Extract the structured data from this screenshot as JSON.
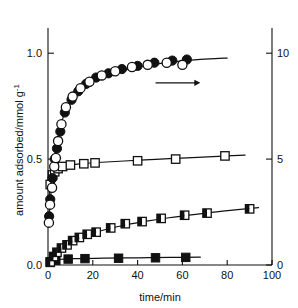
{
  "figure": {
    "background_color": "#ffffff",
    "ink_color": "#111111"
  },
  "axes": {
    "x": {
      "label": "time/min",
      "ticks": [
        0,
        20,
        40,
        60,
        80,
        100
      ],
      "tick_labels": [
        "0",
        "20",
        "40",
        "60",
        "80",
        "100"
      ],
      "range": [
        0,
        100
      ]
    },
    "y_left": {
      "label_main": "amount adsorbed/mmol g",
      "label_exponent": "-1",
      "ticks": [
        0.0,
        0.5,
        1.0
      ],
      "tick_labels": [
        "0.0",
        "0.5",
        "1.0"
      ],
      "range": [
        0,
        1.1
      ]
    },
    "y_right": {
      "label": "",
      "ticks": [
        0,
        5,
        10
      ],
      "tick_labels": [
        "0",
        "5",
        "10"
      ],
      "range": [
        0,
        11
      ]
    }
  },
  "annotations": [
    {
      "name": "right-axis-arrow",
      "type": "arrow",
      "direction": "right",
      "x_start": 48,
      "x_end": 68,
      "y": 0.86,
      "text": ""
    }
  ],
  "chart_data": {
    "type": "scatter",
    "title": "",
    "xlabel": "time/min",
    "ylabel": "amount adsorbed/mmol g-1",
    "xlim": [
      0,
      100
    ],
    "ylim": [
      0,
      1.1
    ],
    "ylim_right": [
      0,
      11
    ],
    "grid": false,
    "legend_position": "none",
    "series": [
      {
        "name": "filled-circles",
        "marker": "circle-filled",
        "axis": "left",
        "points": [
          [
            0.5,
            0.23
          ],
          [
            1.0,
            0.31
          ],
          [
            2.0,
            0.41
          ],
          [
            3.0,
            0.5
          ],
          [
            4.0,
            0.55
          ],
          [
            5.5,
            0.63
          ],
          [
            7.5,
            0.72
          ],
          [
            10.5,
            0.78
          ],
          [
            13.5,
            0.82
          ],
          [
            17.0,
            0.855
          ],
          [
            21.5,
            0.885
          ],
          [
            27.0,
            0.905
          ],
          [
            33.0,
            0.925
          ],
          [
            40.0,
            0.94
          ],
          [
            47.5,
            0.955
          ],
          [
            55.5,
            0.965
          ],
          [
            62.0,
            0.97
          ]
        ]
      },
      {
        "name": "open-circles",
        "marker": "circle-open",
        "axis": "left",
        "points": [
          [
            0.4,
            0.2
          ],
          [
            0.9,
            0.285
          ],
          [
            1.8,
            0.365
          ],
          [
            2.8,
            0.465
          ],
          [
            3.5,
            0.505
          ],
          [
            4.5,
            0.585
          ],
          [
            6.0,
            0.665
          ],
          [
            8.0,
            0.745
          ],
          [
            11.0,
            0.795
          ],
          [
            14.5,
            0.835
          ],
          [
            18.5,
            0.865
          ],
          [
            24.0,
            0.895
          ],
          [
            30.0,
            0.915
          ],
          [
            37.5,
            0.935
          ],
          [
            44.5,
            0.945
          ],
          [
            53.0,
            0.955
          ],
          [
            60.0,
            0.945
          ]
        ]
      },
      {
        "name": "open-squares",
        "marker": "square-open",
        "axis": "left",
        "points": [
          [
            1.0,
            0.38
          ],
          [
            2.0,
            0.425
          ],
          [
            3.0,
            0.44
          ],
          [
            4.5,
            0.455
          ],
          [
            6.5,
            0.465
          ],
          [
            10.0,
            0.472
          ],
          [
            16.0,
            0.478
          ],
          [
            21.0,
            0.482
          ],
          [
            40.0,
            0.492
          ],
          [
            57.0,
            0.5
          ],
          [
            79.0,
            0.515
          ]
        ]
      },
      {
        "name": "half-filled-squares",
        "marker": "square-half",
        "axis": "left",
        "points": [
          [
            1.0,
            0.015
          ],
          [
            2.5,
            0.04
          ],
          [
            4.0,
            0.06
          ],
          [
            6.0,
            0.08
          ],
          [
            8.5,
            0.095
          ],
          [
            11.0,
            0.115
          ],
          [
            14.0,
            0.13
          ],
          [
            17.5,
            0.145
          ],
          [
            21.5,
            0.155
          ],
          [
            28.0,
            0.175
          ],
          [
            34.5,
            0.195
          ],
          [
            42.0,
            0.205
          ],
          [
            50.5,
            0.22
          ],
          [
            61.0,
            0.235
          ],
          [
            71.0,
            0.245
          ],
          [
            90.0,
            0.265
          ]
        ]
      },
      {
        "name": "filled-squares",
        "marker": "square-filled",
        "axis": "left",
        "points": [
          [
            1.0,
            0.012
          ],
          [
            3.5,
            0.022
          ],
          [
            9.0,
            0.028
          ],
          [
            16.5,
            0.03
          ],
          [
            31.5,
            0.032
          ],
          [
            48.0,
            0.034
          ],
          [
            61.5,
            0.036
          ]
        ]
      }
    ],
    "fit_curves": [
      {
        "name": "circles-fit",
        "for_series": "filled-circles",
        "points": [
          [
            0.3,
            0.2
          ],
          [
            1.0,
            0.3
          ],
          [
            2.0,
            0.41
          ],
          [
            3.0,
            0.5
          ],
          [
            4.0,
            0.565
          ],
          [
            5.5,
            0.645
          ],
          [
            7.0,
            0.705
          ],
          [
            9.0,
            0.755
          ],
          [
            11.5,
            0.795
          ],
          [
            14.5,
            0.828
          ],
          [
            18.0,
            0.855
          ],
          [
            22.0,
            0.878
          ],
          [
            27.0,
            0.898
          ],
          [
            33.0,
            0.917
          ],
          [
            40.0,
            0.934
          ],
          [
            48.0,
            0.948
          ],
          [
            56.0,
            0.959
          ],
          [
            64.0,
            0.967
          ],
          [
            72.0,
            0.973
          ],
          [
            80.0,
            0.977
          ]
        ]
      },
      {
        "name": "open-squares-fit",
        "for_series": "open-squares",
        "points": [
          [
            0.5,
            0.33
          ],
          [
            1.5,
            0.41
          ],
          [
            3.0,
            0.443
          ],
          [
            5.0,
            0.458
          ],
          [
            8.0,
            0.468
          ],
          [
            14.0,
            0.477
          ],
          [
            22.0,
            0.484
          ],
          [
            34.0,
            0.491
          ],
          [
            48.0,
            0.499
          ],
          [
            62.0,
            0.506
          ],
          [
            76.0,
            0.513
          ],
          [
            88.0,
            0.519
          ]
        ]
      },
      {
        "name": "half-squares-fit",
        "for_series": "half-filled-squares",
        "points": [
          [
            0.5,
            0.008
          ],
          [
            2.0,
            0.033
          ],
          [
            4.0,
            0.058
          ],
          [
            7.0,
            0.085
          ],
          [
            10.5,
            0.108
          ],
          [
            15.0,
            0.131
          ],
          [
            20.0,
            0.15
          ],
          [
            27.0,
            0.171
          ],
          [
            35.0,
            0.19
          ],
          [
            44.0,
            0.207
          ],
          [
            54.0,
            0.223
          ],
          [
            65.0,
            0.238
          ],
          [
            78.0,
            0.254
          ],
          [
            94.0,
            0.271
          ]
        ]
      },
      {
        "name": "filled-squares-fit",
        "for_series": "filled-squares",
        "points": [
          [
            0.5,
            0.008
          ],
          [
            2.0,
            0.02
          ],
          [
            5.0,
            0.026
          ],
          [
            12.0,
            0.03
          ],
          [
            25.0,
            0.032
          ],
          [
            40.0,
            0.034
          ],
          [
            55.0,
            0.036
          ],
          [
            68.0,
            0.037
          ]
        ]
      }
    ]
  }
}
